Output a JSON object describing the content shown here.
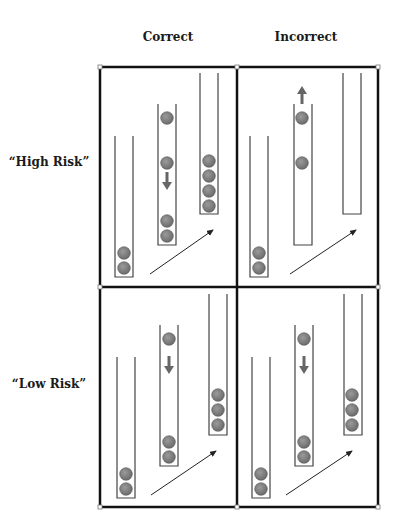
{
  "headers": {
    "columns": [
      "Correct",
      "Incorrect"
    ],
    "rows": [
      "“High Risk”",
      "“Low Risk”"
    ]
  },
  "colors": {
    "frame": "#111111",
    "tube": "#444444",
    "ball": "#7a7a7a",
    "ball_edge": "#555555",
    "arrow_motion": "#666666",
    "arrow_trend": "#222222"
  },
  "panels": [
    {
      "id": "high-risk-correct",
      "tubes": [
        {
          "balls": 2,
          "closed_bottom": true
        },
        {
          "balls": 4,
          "arrow": "down"
        },
        {
          "balls": 4
        }
      ]
    },
    {
      "id": "high-risk-incorrect",
      "tubes": [
        {
          "balls": 2
        },
        {
          "balls": 2,
          "arrow": "up"
        },
        {
          "balls": 0
        }
      ]
    },
    {
      "id": "low-risk-correct",
      "tubes": [
        {
          "balls": 2
        },
        {
          "balls": 3,
          "arrow": "down"
        },
        {
          "balls": 3
        }
      ]
    },
    {
      "id": "low-risk-incorrect",
      "tubes": [
        {
          "balls": 2
        },
        {
          "balls": 3,
          "arrow": "down"
        },
        {
          "balls": 3
        }
      ]
    }
  ]
}
